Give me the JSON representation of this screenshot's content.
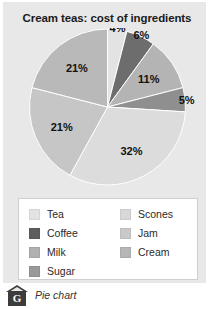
{
  "figure": {
    "caption": "Pie chart",
    "caption_icon": "glossary-g-icon",
    "icon_letter": "G"
  },
  "chart_data": {
    "type": "pie",
    "title": "Cream teas: cost of ingredients",
    "xlabel": "",
    "ylabel": "",
    "legend_position": "bottom",
    "grid": false,
    "categories": [
      "Tea",
      "Coffee",
      "Milk",
      "Sugar",
      "Scones",
      "Jam",
      "Cream"
    ],
    "values": [
      4,
      6,
      11,
      5,
      32,
      21,
      21
    ],
    "data_labels": [
      "4%",
      "6%",
      "11%",
      "5%",
      "32%",
      "21%",
      "21%"
    ],
    "colors": [
      "#e3e3e3",
      "#6d6d6d",
      "#b4b4b4",
      "#8f8f8f",
      "#dcdcdc",
      "#c6c6c6",
      "#b9b9b9"
    ],
    "start_angle_deg": 0,
    "direction": "clockwise",
    "total": 100
  },
  "legend": {
    "left_column": [
      {
        "label": "Tea",
        "color": "#e3e3e3"
      },
      {
        "label": "Coffee",
        "color": "#5e5e5e"
      },
      {
        "label": "Milk",
        "color": "#b0b0b0"
      },
      {
        "label": "Sugar",
        "color": "#9a9a9a"
      }
    ],
    "right_column": [
      {
        "label": "Scones",
        "color": "#d8d8d8"
      },
      {
        "label": "Jam",
        "color": "#c9c9c9"
      },
      {
        "label": "Cream",
        "color": "#b6b6b6"
      }
    ]
  }
}
